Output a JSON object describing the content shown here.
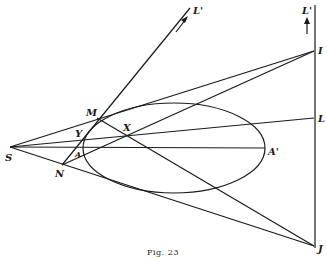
{
  "figure": {
    "caption": "Fig. 23",
    "labels": {
      "S": "S",
      "M": "M",
      "N": "N",
      "Y": "Y",
      "A": "A",
      "X": "X",
      "A_prime": "A'",
      "I": "I",
      "L": "L",
      "J": "J",
      "L_prime_oblique": "L'",
      "L_prime_vertical": "L'"
    },
    "points": {
      "S": [
        10,
        147
      ],
      "M": [
        97,
        118
      ],
      "N": [
        62,
        165
      ],
      "Y": [
        81,
        139
      ],
      "A": [
        82,
        150
      ],
      "X": [
        127,
        134
      ],
      "A_prime": [
        265,
        148
      ],
      "I": [
        314,
        51
      ],
      "L": [
        314,
        118
      ],
      "J": [
        314,
        246
      ],
      "L_prime_top": [
        190,
        8
      ]
    },
    "ellipse": {
      "cx": 174,
      "cy": 148,
      "rx": 91,
      "ry": 45
    },
    "stroke_color": "#1a1a1a",
    "background": "#ffffff"
  }
}
